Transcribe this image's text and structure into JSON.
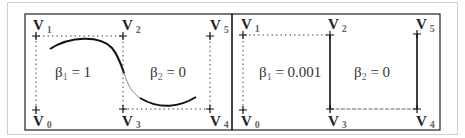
{
  "panels": [
    {
      "id": "left",
      "beta1_label": "β",
      "beta1_sub": "1",
      "beta1_value": " = 1",
      "beta2_label": "β",
      "beta2_sub": "2",
      "beta2_value": " = 0",
      "vertices": [
        {
          "name": "V",
          "sub": "0"
        },
        {
          "name": "V",
          "sub": "1"
        },
        {
          "name": "V",
          "sub": "2"
        },
        {
          "name": "V",
          "sub": "3"
        },
        {
          "name": "V",
          "sub": "4"
        },
        {
          "name": "V",
          "sub": "5"
        }
      ]
    },
    {
      "id": "right",
      "beta1_label": "β",
      "beta1_sub": "1",
      "beta1_value": " = 0.001",
      "beta2_label": "β",
      "beta2_sub": "2",
      "beta2_value": " = 0",
      "vertices": [
        {
          "name": "V",
          "sub": "0"
        },
        {
          "name": "V",
          "sub": "1"
        },
        {
          "name": "V",
          "sub": "2"
        },
        {
          "name": "V",
          "sub": "3"
        },
        {
          "name": "V",
          "sub": "4"
        },
        {
          "name": "V",
          "sub": "5"
        }
      ]
    }
  ],
  "colors": {
    "frame": "#222222",
    "curve": "#111111",
    "dotted": "#444444"
  }
}
